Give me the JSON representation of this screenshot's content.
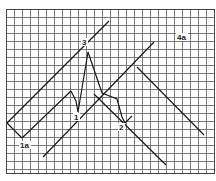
{
  "diagram": {
    "type": "elliott-wave-channel-on-grid",
    "grid": {
      "x0": 6,
      "y0": 9,
      "x1": 214,
      "y1": 173,
      "cell": 8,
      "color": "#6b6b6b"
    },
    "line_color": "#1a1a1a",
    "labels": [
      {
        "id": "label-1a",
        "text": "1a",
        "x": 20,
        "y": 148
      },
      {
        "id": "label-1",
        "text": "1",
        "x": 74,
        "y": 120
      },
      {
        "id": "label-3",
        "text": "3",
        "x": 82,
        "y": 45
      },
      {
        "id": "label-2",
        "text": "2",
        "x": 119,
        "y": 130
      },
      {
        "id": "label-4a",
        "text": "4a",
        "x": 177,
        "y": 40
      }
    ],
    "lines": [
      {
        "name": "upper-channel-line",
        "points": [
          [
            7,
            123
          ],
          [
            109,
            21
          ]
        ]
      },
      {
        "name": "channel-left-edge",
        "points": [
          [
            7,
            123
          ],
          [
            22,
            138
          ]
        ]
      },
      {
        "name": "lower-channel-line",
        "points": [
          [
            22,
            138
          ],
          [
            71,
            91
          ]
        ]
      },
      {
        "name": "wave-path",
        "points": [
          [
            71,
            91
          ],
          [
            76,
            101
          ],
          [
            78,
            112
          ],
          [
            88,
            52
          ],
          [
            102,
            93
          ],
          [
            117,
            99
          ],
          [
            122,
            117
          ],
          [
            125,
            123
          ],
          [
            132,
            116
          ]
        ]
      },
      {
        "name": "parallel-support-line",
        "points": [
          [
            43,
            157
          ],
          [
            154,
            42
          ]
        ]
      },
      {
        "name": "descending-line-upper",
        "points": [
          [
            137,
            67
          ],
          [
            204,
            135
          ]
        ]
      },
      {
        "name": "descending-line-lower",
        "points": [
          [
            94,
            94
          ],
          [
            166,
            165
          ]
        ]
      }
    ]
  }
}
